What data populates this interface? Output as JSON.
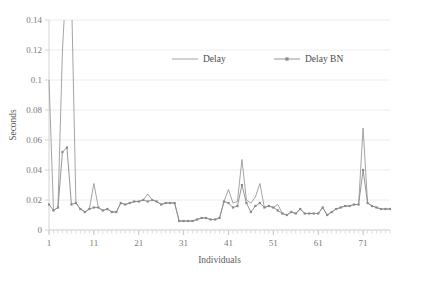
{
  "chart_data": {
    "type": "line",
    "title": "",
    "xlabel": "Individuals",
    "ylabel": "Seconds",
    "xlim": [
      1,
      77
    ],
    "ylim": [
      0,
      0.14
    ],
    "ytick_labels": [
      "0",
      "0.02",
      "0.04",
      "0.06",
      "0.08",
      "0.1",
      "0.12",
      "0.14"
    ],
    "ytick_values": [
      0,
      0.02,
      0.04,
      0.06,
      0.08,
      0.1,
      0.12,
      0.14
    ],
    "xtick_labels": [
      "1",
      "11",
      "21",
      "31",
      "41",
      "51",
      "61",
      "71"
    ],
    "xtick_values": [
      1,
      11,
      21,
      31,
      41,
      51,
      61,
      71
    ],
    "grid": "horizontal",
    "legend_position": "top-center",
    "colors": {
      "delay": "#9a9a9a",
      "delay_bn": "#8a8a8a",
      "grid": "#ececec",
      "axis": "#d4d4d4"
    },
    "x": [
      1,
      2,
      3,
      4,
      5,
      6,
      7,
      8,
      9,
      10,
      11,
      12,
      13,
      14,
      15,
      16,
      17,
      18,
      19,
      20,
      21,
      22,
      23,
      24,
      25,
      26,
      27,
      28,
      29,
      30,
      31,
      32,
      33,
      34,
      35,
      36,
      37,
      38,
      39,
      40,
      41,
      42,
      43,
      44,
      45,
      46,
      47,
      48,
      49,
      50,
      51,
      52,
      53,
      54,
      55,
      56,
      57,
      58,
      59,
      60,
      61,
      62,
      63,
      64,
      65,
      66,
      67,
      68,
      69,
      70,
      71,
      72,
      73,
      74,
      75,
      76,
      77
    ],
    "series": [
      {
        "name": "Delay",
        "marker": "none",
        "values": [
          0.1,
          0.013,
          0.015,
          0.12,
          0.175,
          0.16,
          0.018,
          0.014,
          0.012,
          0.014,
          0.031,
          0.015,
          0.013,
          0.014,
          0.012,
          0.012,
          0.018,
          0.017,
          0.018,
          0.019,
          0.019,
          0.02,
          0.024,
          0.02,
          0.019,
          0.017,
          0.018,
          0.018,
          0.018,
          0.006,
          0.006,
          0.006,
          0.006,
          0.007,
          0.008,
          0.008,
          0.007,
          0.007,
          0.008,
          0.019,
          0.027,
          0.018,
          0.019,
          0.047,
          0.02,
          0.018,
          0.022,
          0.031,
          0.015,
          0.016,
          0.015,
          0.017,
          0.011,
          0.01,
          0.012,
          0.011,
          0.014,
          0.011,
          0.011,
          0.011,
          0.011,
          0.015,
          0.01,
          0.012,
          0.014,
          0.015,
          0.016,
          0.016,
          0.017,
          0.017,
          0.068,
          0.018,
          0.016,
          0.015,
          0.014,
          0.014,
          0.014
        ]
      },
      {
        "name": "Delay BN",
        "marker": "square",
        "values": [
          0.017,
          0.013,
          0.015,
          0.052,
          0.055,
          0.017,
          0.018,
          0.014,
          0.012,
          0.014,
          0.015,
          0.015,
          0.013,
          0.014,
          0.012,
          0.012,
          0.018,
          0.017,
          0.018,
          0.019,
          0.019,
          0.02,
          0.019,
          0.02,
          0.019,
          0.017,
          0.018,
          0.018,
          0.018,
          0.006,
          0.006,
          0.006,
          0.006,
          0.007,
          0.008,
          0.008,
          0.007,
          0.007,
          0.008,
          0.019,
          0.018,
          0.015,
          0.016,
          0.03,
          0.018,
          0.012,
          0.016,
          0.018,
          0.015,
          0.016,
          0.015,
          0.013,
          0.011,
          0.01,
          0.012,
          0.011,
          0.014,
          0.011,
          0.011,
          0.011,
          0.011,
          0.015,
          0.01,
          0.012,
          0.014,
          0.015,
          0.016,
          0.016,
          0.017,
          0.017,
          0.04,
          0.018,
          0.016,
          0.015,
          0.014,
          0.014,
          0.014
        ]
      }
    ],
    "legend": [
      {
        "label": "Delay",
        "marker": "none"
      },
      {
        "label": "Delay BN",
        "marker": "square"
      }
    ]
  }
}
